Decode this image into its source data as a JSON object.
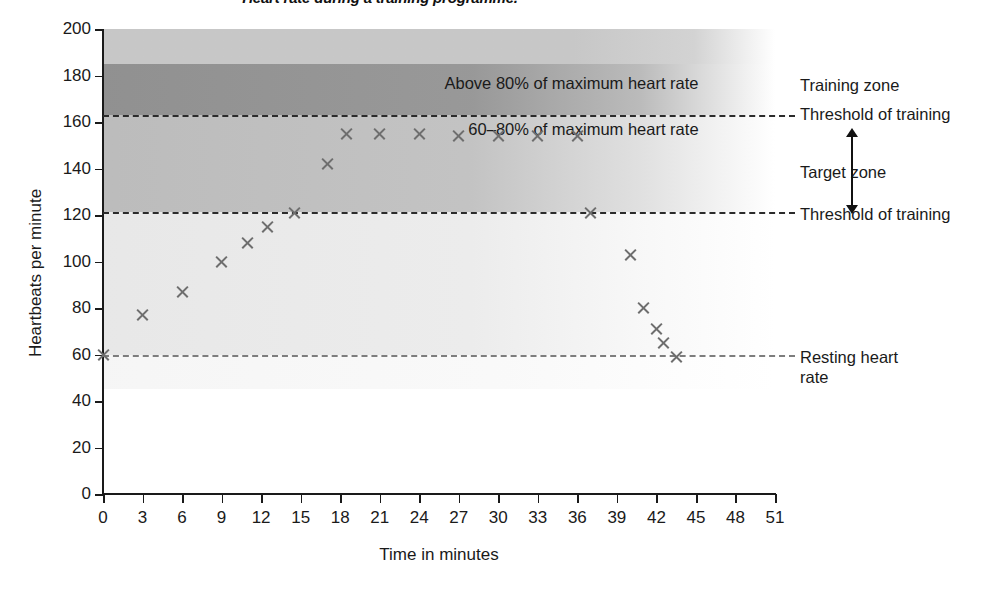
{
  "chart_data": {
    "type": "scatter",
    "title": "Heart rate during a training programme.",
    "xlabel": "Time in minutes",
    "ylabel": "Heartbeats per minute",
    "xlim": [
      0,
      51
    ],
    "ylim": [
      0,
      200
    ],
    "grid": false,
    "legend_position": "right",
    "x_ticks": [
      "0",
      "3",
      "6",
      "9",
      "12",
      "15",
      "18",
      "21",
      "24",
      "27",
      "30",
      "33",
      "36",
      "39",
      "42",
      "45",
      "48",
      "51"
    ],
    "y_ticks": [
      "0",
      "20",
      "40",
      "60",
      "80",
      "100",
      "120",
      "140",
      "160",
      "180",
      "200"
    ],
    "series": [
      {
        "name": "Heart rate",
        "marker": "x",
        "marker_color": "#6e6e6e",
        "points": [
          {
            "x": 0,
            "y": 60
          },
          {
            "x": 3,
            "y": 77
          },
          {
            "x": 6,
            "y": 87
          },
          {
            "x": 9,
            "y": 100
          },
          {
            "x": 11,
            "y": 108
          },
          {
            "x": 12.5,
            "y": 115
          },
          {
            "x": 14.5,
            "y": 121
          },
          {
            "x": 17,
            "y": 142
          },
          {
            "x": 18.5,
            "y": 155
          },
          {
            "x": 21,
            "y": 155
          },
          {
            "x": 24,
            "y": 155
          },
          {
            "x": 27,
            "y": 154
          },
          {
            "x": 30,
            "y": 154
          },
          {
            "x": 33,
            "y": 154
          },
          {
            "x": 36,
            "y": 154
          },
          {
            "x": 37,
            "y": 121
          },
          {
            "x": 40,
            "y": 103
          },
          {
            "x": 41,
            "y": 80
          },
          {
            "x": 42,
            "y": 71
          },
          {
            "x": 42.5,
            "y": 65
          },
          {
            "x": 43.5,
            "y": 59
          }
        ]
      }
    ],
    "bands": [
      {
        "name": "cap",
        "from": 185,
        "to": 200,
        "shade": "light"
      },
      {
        "name": "above-80-percent",
        "from": 163,
        "to": 185,
        "shade": "dark"
      },
      {
        "name": "target-zone",
        "from": 121.5,
        "to": 163,
        "shade": "medium"
      },
      {
        "name": "below-threshold",
        "from": 60,
        "to": 121.5,
        "shade": "faint"
      }
    ],
    "reference_lines": [
      {
        "label": "Threshold of training",
        "value": 163,
        "style": "dashed"
      },
      {
        "label": "Threshold of training",
        "value": 121.5,
        "style": "dashed"
      },
      {
        "label": "Resting heart rate",
        "value": 60,
        "style": "dashed"
      }
    ],
    "annotations": [
      {
        "text": "Above 80% of maximum heart rate",
        "value": 176
      },
      {
        "text": "60–80% of maximum heart rate",
        "value": 156
      }
    ]
  },
  "right_labels": {
    "training_zone": "Training zone",
    "threshold_upper": "Threshold of training",
    "target_zone": "Target zone",
    "threshold_lower": "Threshold of training",
    "resting_heart_rate": "Resting heart\nrate",
    "resting_heart_rate_line1": "Resting heart",
    "resting_heart_rate_line2": "rate"
  },
  "colors": {
    "axis": "#1a1a1a",
    "marker": "#6e6e6e",
    "dash_dark": "#2b2b2b",
    "dash_light": "#7d7d7d",
    "band_dark": "#8c8c8c",
    "band_medium": "#b0b0b0",
    "band_light": "#c4c4c4",
    "band_faint": "#e0e0e0",
    "background": "#ffffff"
  }
}
